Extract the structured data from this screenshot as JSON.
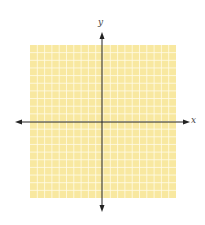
{
  "diagram": {
    "type": "coordinate-plane",
    "x_axis_label": "x",
    "y_axis_label": "y",
    "grid": {
      "cells_x": 20,
      "cells_y": 20,
      "fill_color": "#f8e8a0",
      "line_color": "#fffbe8"
    },
    "axis_color": "#222222"
  }
}
